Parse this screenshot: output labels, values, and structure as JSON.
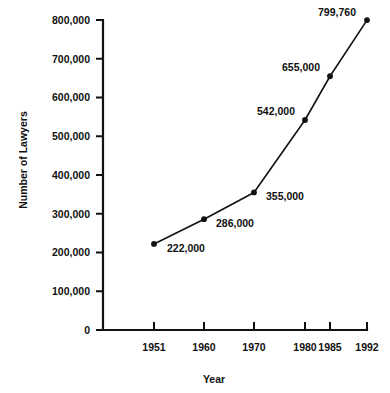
{
  "chart_data": {
    "type": "line",
    "title": "",
    "subtitle": "",
    "xlabel": "Year",
    "ylabel": "Number of Lawyers",
    "categories": [
      "1951",
      "1960",
      "1970",
      "1980",
      "1985",
      "1992"
    ],
    "x": [
      1951,
      1960,
      1970,
      1980,
      1985,
      1992
    ],
    "values": [
      222000,
      286000,
      355000,
      542000,
      655000,
      799760
    ],
    "point_labels": [
      "222,000",
      "286,000",
      "355,000",
      "542,000",
      "655,000",
      "799,760"
    ],
    "ylim": [
      0,
      800000
    ],
    "xlim": [
      1951,
      1992
    ],
    "ytick_values": [
      0,
      100000,
      200000,
      300000,
      400000,
      500000,
      600000,
      700000,
      800000
    ],
    "ytick_labels": [
      "0",
      "100,000",
      "200,000",
      "300,000",
      "400,000",
      "500,000",
      "600,000",
      "700,000",
      "800,000"
    ],
    "xtick_labels": [
      "1951",
      "1960",
      "1970",
      "1980",
      "1985",
      "1992"
    ],
    "grid": false,
    "legend": false,
    "legend_position": "none",
    "markers": "filled-circle",
    "line_color": "#111111",
    "marker_color": "#111111",
    "axis_color": "#111111",
    "background_color": "#ffffff"
  },
  "axis": {
    "y_title": "Number of Lawyers",
    "x_title": "Year"
  },
  "ticks": {
    "y": [
      {
        "label": "800,000",
        "y": 20
      },
      {
        "label": "700,000",
        "y": 58.75
      },
      {
        "label": "600,000",
        "y": 97.5
      },
      {
        "label": "500,000",
        "y": 136.25
      },
      {
        "label": "400,000",
        "y": 175
      },
      {
        "label": "300,000",
        "y": 213.75
      },
      {
        "label": "200,000",
        "y": 252.5
      },
      {
        "label": "100,000",
        "y": 291.25
      },
      {
        "label": "0",
        "y": 330
      }
    ],
    "x": [
      {
        "label": "1951",
        "x": 154
      },
      {
        "label": "1960",
        "x": 204
      },
      {
        "label": "1970",
        "x": 254
      },
      {
        "label": "1980",
        "x": 305
      },
      {
        "label": "1985",
        "x": 330
      },
      {
        "label": "1992",
        "x": 367
      }
    ]
  },
  "points": [
    {
      "label": "222,000",
      "x": 154,
      "y": 243.97,
      "lx": 167,
      "ly": 252,
      "anchor": "start"
    },
    {
      "label": "286,000",
      "x": 204,
      "y": 219.17,
      "lx": 216,
      "ly": 227,
      "anchor": "start"
    },
    {
      "label": "355,000",
      "x": 254,
      "y": 192.44,
      "lx": 266,
      "ly": 200,
      "anchor": "start"
    },
    {
      "label": "542,000",
      "x": 305,
      "y": 120.01,
      "lx": 295,
      "ly": 115,
      "anchor": "end"
    },
    {
      "label": "655,000",
      "x": 330,
      "y": 76.24,
      "lx": 320,
      "ly": 71,
      "anchor": "end"
    },
    {
      "label": "799,760",
      "x": 367,
      "y": 20.09,
      "lx": 356,
      "ly": 16,
      "anchor": "end"
    }
  ]
}
